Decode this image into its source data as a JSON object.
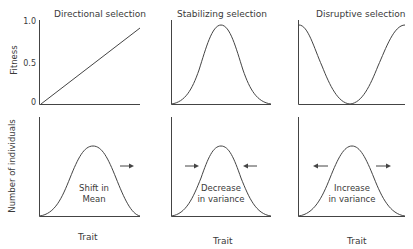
{
  "titles": {
    "directional": "Directional selection",
    "stabilizing": "Stabilizing selection",
    "disruptive": "Disruptive selection"
  },
  "axes": {
    "fitness_label": "Fitness",
    "fitness_ticks": [
      "1.0",
      "0.5",
      "0"
    ],
    "population_label": "Number of individuals",
    "x_label": "Trait"
  },
  "annotations": {
    "directional_line1": "Shift in",
    "directional_line2": "Mean",
    "stabilizing_line1": "Decrease",
    "stabilizing_line2": "in variance",
    "disruptive_line1": "Increase",
    "disruptive_line2": "in variance"
  },
  "arrows": {
    "directional": [
      "right"
    ],
    "stabilizing": [
      "right-pointing-inward-left",
      "left-pointing-inward-right"
    ],
    "disruptive": [
      "left-outward",
      "right-outward"
    ]
  },
  "colors": {
    "line": "#444444",
    "text": "#3a3a3a"
  }
}
